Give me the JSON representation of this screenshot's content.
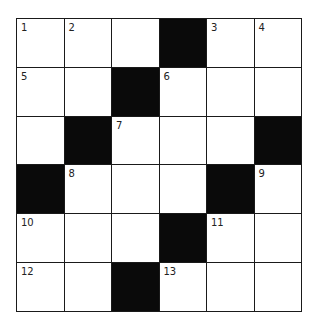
{
  "puzzle": {
    "rows": 6,
    "cols": 6,
    "colors": {
      "block": "#0a0a0a",
      "cell": "#ffffff",
      "line": "#1a1a1a"
    },
    "cells": [
      [
        {
          "n": "1"
        },
        {
          "n": "2"
        },
        {
          "n": ""
        },
        {
          "black": true
        },
        {
          "n": "3"
        },
        {
          "n": "4"
        }
      ],
      [
        {
          "n": "5"
        },
        {
          "n": ""
        },
        {
          "black": true
        },
        {
          "n": "6"
        },
        {
          "n": ""
        },
        {
          "n": ""
        }
      ],
      [
        {
          "n": ""
        },
        {
          "black": true
        },
        {
          "n": "7"
        },
        {
          "n": ""
        },
        {
          "n": ""
        },
        {
          "black": true
        }
      ],
      [
        {
          "black": true
        },
        {
          "n": "8"
        },
        {
          "n": ""
        },
        {
          "n": ""
        },
        {
          "black": true
        },
        {
          "n": "9"
        }
      ],
      [
        {
          "n": "10"
        },
        {
          "n": ""
        },
        {
          "n": ""
        },
        {
          "black": true
        },
        {
          "n": "11"
        },
        {
          "n": ""
        }
      ],
      [
        {
          "n": "12"
        },
        {
          "n": ""
        },
        {
          "black": true
        },
        {
          "n": "13"
        },
        {
          "n": ""
        },
        {
          "n": ""
        }
      ]
    ]
  }
}
